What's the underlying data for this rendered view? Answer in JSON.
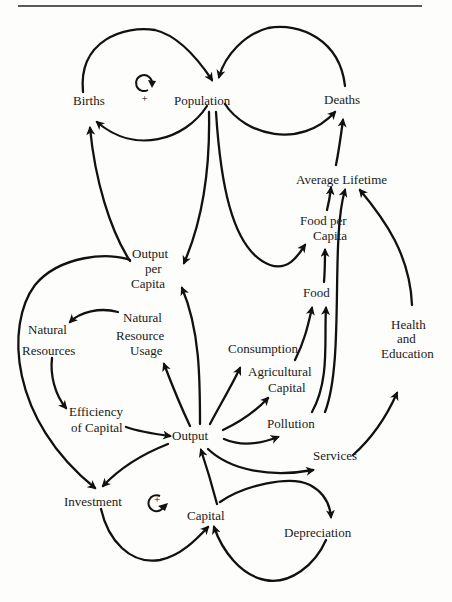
{
  "diagram": {
    "type": "causal-loop-diagram",
    "nodes": {
      "births": "Births",
      "population": "Population",
      "deaths": "Deaths",
      "average_lifetime": "Average Lifetime",
      "food_per_capita_1": "Food per",
      "food_per_capita_2": "Capita",
      "output_per_capita_1": "Output",
      "output_per_capita_2": "per",
      "output_per_capita_3": "Capita",
      "food": "Food",
      "natural_resource_usage_1": "Natural",
      "natural_resource_usage_2": "Resource",
      "natural_resource_usage_3": "Usage",
      "natural_resources_1": "Natural",
      "natural_resources_2": "Resources",
      "consumption": "Consumption",
      "agricultural_capital_1": "Agricultural",
      "agricultural_capital_2": "Capital",
      "health_education_1": "Health",
      "health_education_2": "and",
      "health_education_3": "Education",
      "efficiency_1": "Efficiency",
      "efficiency_2": "of Capital",
      "output": "Output",
      "pollution": "Pollution",
      "services": "Services",
      "investment": "Investment",
      "capital": "Capital",
      "depreciation": "Depreciation"
    },
    "loops": [
      {
        "name": "population-births-loop",
        "sign": "+"
      },
      {
        "name": "capital-investment-loop",
        "sign": "+"
      }
    ],
    "edges": [
      {
        "from": "Births",
        "to": "Population"
      },
      {
        "from": "Population",
        "to": "Births"
      },
      {
        "from": "Deaths",
        "to": "Population"
      },
      {
        "from": "Population",
        "to": "Deaths"
      },
      {
        "from": "Average Lifetime",
        "to": "Deaths"
      },
      {
        "from": "Food per Capita",
        "to": "Average Lifetime"
      },
      {
        "from": "Pollution",
        "to": "Average Lifetime"
      },
      {
        "from": "Health and Education",
        "to": "Average Lifetime"
      },
      {
        "from": "Population",
        "to": "Output per Capita"
      },
      {
        "from": "Population",
        "to": "Food per Capita"
      },
      {
        "from": "Output per Capita",
        "to": "Births"
      },
      {
        "from": "Output per Capita",
        "to": "Investment"
      },
      {
        "from": "Food",
        "to": "Food per Capita"
      },
      {
        "from": "Agricultural Capital",
        "to": "Food"
      },
      {
        "from": "Pollution",
        "to": "Food"
      },
      {
        "from": "Natural Resource Usage",
        "to": "Natural Resources"
      },
      {
        "from": "Natural Resources",
        "to": "Efficiency of Capital"
      },
      {
        "from": "Efficiency of Capital",
        "to": "Output"
      },
      {
        "from": "Output",
        "to": "Natural Resource Usage"
      },
      {
        "from": "Output",
        "to": "Output per Capita"
      },
      {
        "from": "Output",
        "to": "Consumption"
      },
      {
        "from": "Output",
        "to": "Agricultural Capital"
      },
      {
        "from": "Output",
        "to": "Pollution"
      },
      {
        "from": "Output",
        "to": "Services"
      },
      {
        "from": "Output",
        "to": "Investment"
      },
      {
        "from": "Services",
        "to": "Health and Education"
      },
      {
        "from": "Investment",
        "to": "Capital"
      },
      {
        "from": "Capital",
        "to": "Output"
      },
      {
        "from": "Capital",
        "to": "Depreciation"
      },
      {
        "from": "Depreciation",
        "to": "Capital"
      }
    ]
  }
}
